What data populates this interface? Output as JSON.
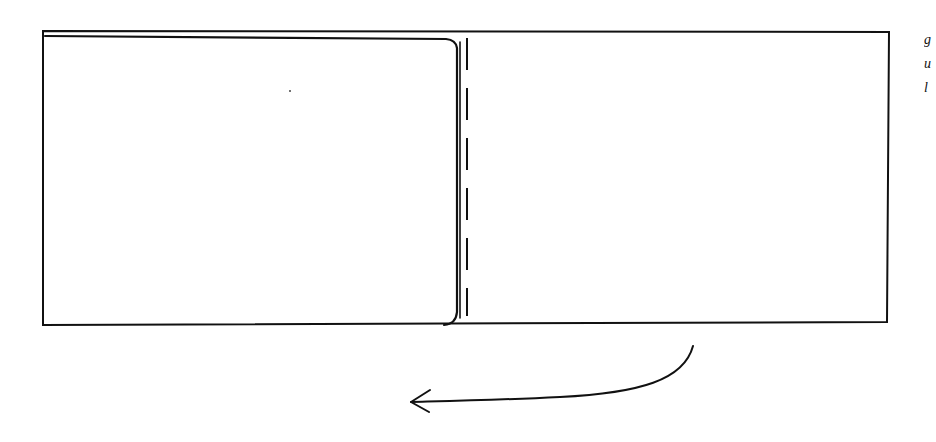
{
  "diagram": {
    "stroke_color": "#111111",
    "background": "#ffffff",
    "outer_sheet": {
      "x": 42,
      "y": 30,
      "width": 847,
      "height": 295
    },
    "left_panel": {
      "x": 44,
      "y": 34,
      "width": 415,
      "height": 290,
      "corner": "rounded right corners"
    },
    "fold_line": {
      "x": 466,
      "y1": 38,
      "y2": 316,
      "style": "dashed"
    },
    "arrow": {
      "direction": "left",
      "start": [
        692,
        345
      ],
      "end": [
        410,
        403
      ]
    },
    "edge_text": {
      "lines": [
        "g",
        "u",
        "l"
      ],
      "note": "partially cut off at right edge"
    }
  }
}
